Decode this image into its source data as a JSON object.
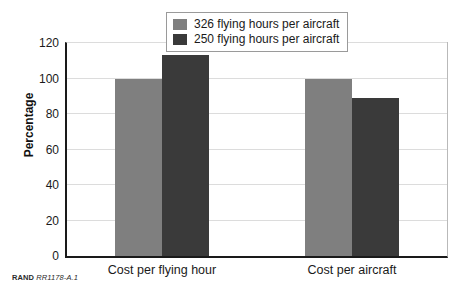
{
  "chart_data": {
    "type": "bar",
    "title": "",
    "xlabel": "",
    "ylabel": "Percentage",
    "ylim": [
      0,
      120
    ],
    "ytick_step": 20,
    "yticks": [
      0,
      20,
      40,
      60,
      80,
      100,
      120
    ],
    "ytick_labels": [
      "0",
      "20",
      "40",
      "60",
      "80",
      "100",
      "120"
    ],
    "grid": "horizontal",
    "legend_position": "top-center",
    "categories": [
      "Cost per flying hour",
      "Cost per aircraft"
    ],
    "series": [
      {
        "name": "326 flying hours per aircraft",
        "color": "#7f7f7f",
        "values": [
          100,
          100
        ]
      },
      {
        "name": "250 flying hours per aircraft",
        "color": "#3a3a3a",
        "values": [
          113,
          89
        ]
      }
    ]
  },
  "legend": {
    "entries": [
      {
        "label": "326 flying hours per aircraft",
        "color": "#7f7f7f"
      },
      {
        "label": "250 flying hours per aircraft",
        "color": "#3a3a3a"
      }
    ]
  },
  "footer": {
    "brand": "RAND",
    "id": "RR1178-A.1"
  },
  "colors": {
    "series_light": "#7f7f7f",
    "series_dark": "#3a3a3a",
    "axis": "#1a1a1a",
    "gridline": "#dcdcdc",
    "frame_light": "#b9b9b9",
    "background": "#ffffff"
  }
}
